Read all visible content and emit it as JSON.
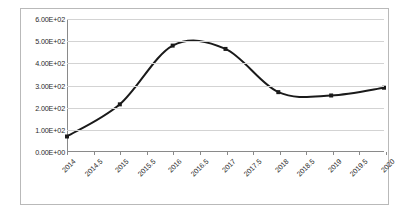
{
  "chart_data": {
    "type": "line",
    "title": "",
    "subtitle": "",
    "xlabel": "",
    "ylabel": "",
    "grid": true,
    "legend": false,
    "legend_position": "none",
    "line_color": "#1a1a1a",
    "marker_color": "#1a1a1a",
    "marker_shape": "square",
    "smoothed": true,
    "xlim": [
      2014,
      2020
    ],
    "ylim": [
      0,
      600
    ],
    "ytick_values": [
      0,
      100,
      200,
      300,
      400,
      500,
      600
    ],
    "ytick_labels": [
      "0.00E+00",
      "1.00E+02",
      "2.00E+02",
      "3.00E+02",
      "4.00E+02",
      "5.00E+02",
      "6.00E+02"
    ],
    "xtick_labels": [
      "2014",
      "2014.5",
      "2015",
      "2015.5",
      "2016",
      "2016.5",
      "2017",
      "2017.5",
      "2018",
      "2018.5",
      "2019",
      "2019.5",
      "2020"
    ],
    "xtick_values": [
      2014,
      2014.5,
      2015,
      2015.5,
      2016,
      2016.5,
      2017,
      2017.5,
      2018,
      2018.5,
      2019,
      2019.5,
      2020
    ],
    "x": [
      2014,
      2015,
      2016,
      2017,
      2018,
      2019,
      2020
    ],
    "values": [
      70,
      215,
      480,
      465,
      270,
      255,
      290
    ],
    "series": [
      {
        "name": "",
        "x": [
          2014,
          2015,
          2016,
          2017,
          2018,
          2019,
          2020
        ],
        "values": [
          70,
          215,
          480,
          465,
          270,
          255,
          290
        ]
      }
    ]
  }
}
